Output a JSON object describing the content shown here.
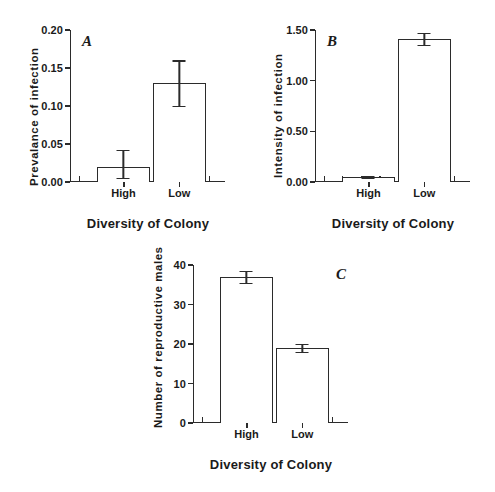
{
  "figure": {
    "background": "#ffffff",
    "ink_color": "#2b2b2b",
    "shared_xlabel": "Diversity of Colony",
    "shared_categories": [
      "High",
      "Low"
    ]
  },
  "panels": [
    {
      "letter": "A",
      "ylabel": "Prevalance of infection",
      "xlabel": "Diversity of Colony",
      "yticks": [
        "0.00",
        "0.05",
        "0.10",
        "0.15",
        "0.20"
      ],
      "xticks": [
        "High",
        "Low"
      ]
    },
    {
      "letter": "B",
      "ylabel": "Intensity  of  infection",
      "xlabel": "Diversity of Colony",
      "yticks": [
        "0.00",
        "0.50",
        "1.00",
        "1.50"
      ],
      "xticks": [
        "High",
        "Low"
      ]
    },
    {
      "letter": "C",
      "ylabel": "Number of reproductive males",
      "xlabel": "Diversity of Colony",
      "yticks": [
        "0",
        "10",
        "20",
        "30",
        "40"
      ],
      "xticks": [
        "High",
        "Low"
      ]
    }
  ],
  "chart_data": [
    {
      "type": "bar",
      "panel": "A",
      "title": "",
      "xlabel": "Diversity of Colony",
      "ylabel": "Prevalance of infection",
      "categories": [
        "High",
        "Low"
      ],
      "values": [
        0.02,
        0.13
      ],
      "errors_upper": [
        0.042,
        0.16
      ],
      "errors_lower": [
        0.005,
        0.1
      ],
      "ylim": [
        0.0,
        0.2
      ],
      "ytick_values": [
        0.0,
        0.05,
        0.1,
        0.15,
        0.2
      ],
      "ytick_labels": [
        "0.00",
        "0.05",
        "0.10",
        "0.15",
        "0.20"
      ],
      "grid": false,
      "legend": "none",
      "bar_fill": "#ffffff",
      "bar_edge": "#2b2b2b"
    },
    {
      "type": "bar",
      "panel": "B",
      "title": "",
      "xlabel": "Diversity of Colony",
      "ylabel": "Intensity of infection",
      "categories": [
        "High",
        "Low"
      ],
      "values": [
        0.05,
        1.41
      ],
      "errors_upper": [
        0.06,
        1.47
      ],
      "errors_lower": [
        0.04,
        1.35
      ],
      "ylim": [
        0.0,
        1.5
      ],
      "ytick_values": [
        0.0,
        0.5,
        1.0,
        1.5
      ],
      "ytick_labels": [
        "0.00",
        "0.50",
        "1.00",
        "1.50"
      ],
      "grid": false,
      "legend": "none",
      "bar_fill": "#ffffff",
      "bar_edge": "#2b2b2b"
    },
    {
      "type": "bar",
      "panel": "C",
      "title": "",
      "xlabel": "Diversity of Colony",
      "ylabel": "Number of reproductive males",
      "categories": [
        "High",
        "Low"
      ],
      "values": [
        37,
        19
      ],
      "errors_upper": [
        38.5,
        20.0
      ],
      "errors_lower": [
        35.5,
        18.0
      ],
      "ylim": [
        0,
        40
      ],
      "ytick_values": [
        0,
        10,
        20,
        30,
        40
      ],
      "ytick_labels": [
        "0",
        "10",
        "20",
        "30",
        "40"
      ],
      "grid": false,
      "legend": "none",
      "bar_fill": "#ffffff",
      "bar_edge": "#2b2b2b"
    }
  ]
}
